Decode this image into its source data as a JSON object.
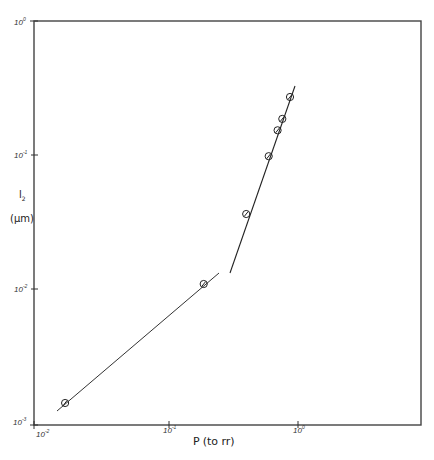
{
  "chart_data": {
    "type": "scatter",
    "title": "",
    "xlabel": "P (torr)",
    "ylabel": "l2 (μm)",
    "xscale": "log",
    "yscale": "log",
    "xlim": [
      0.01,
      10
    ],
    "ylim": [
      0.001,
      1
    ],
    "x_ticks": [
      "10^-2",
      "10^-1",
      "10^0"
    ],
    "y_ticks": [
      "10^-3",
      "10^-2",
      "10^-1",
      "10^0"
    ],
    "grid": false,
    "legend": null,
    "series": [
      {
        "name": "measured",
        "marker": "circle-with-slash",
        "x": [
          0.0172,
          0.193,
          0.405,
          0.6,
          0.7,
          0.76,
          0.87
        ],
        "y": [
          0.00141,
          0.0109,
          0.0363,
          0.098,
          0.153,
          0.186,
          0.271
        ]
      }
    ],
    "fit_lines": [
      {
        "name": "low-pressure fit",
        "x": [
          0.0148,
          0.232
        ],
        "y": [
          0.00123,
          0.0131
        ]
      },
      {
        "name": "high-pressure fit",
        "x": [
          0.28,
          0.92
        ],
        "y": [
          0.0131,
          0.325
        ]
      }
    ]
  },
  "axes": {
    "x_label_main": "P",
    "x_label_unit": "(to rr)",
    "y_label_main": "l",
    "y_label_sub": "2",
    "y_label_unit": "(μm)",
    "x_tick_labels": [
      {
        "base": "10",
        "exp": "-2"
      },
      {
        "base": "10",
        "exp": "-1"
      },
      {
        "base": "10",
        "exp": "0"
      }
    ],
    "y_tick_labels": [
      {
        "base": "10",
        "exp": "0"
      },
      {
        "base": "10",
        "exp": "-1"
      },
      {
        "base": "10",
        "exp": "-2"
      },
      {
        "base": "10",
        "exp": "-3"
      }
    ]
  },
  "colors": {
    "ink": "#2a2a2a",
    "frame": "#444444",
    "background": "#ffffff"
  }
}
